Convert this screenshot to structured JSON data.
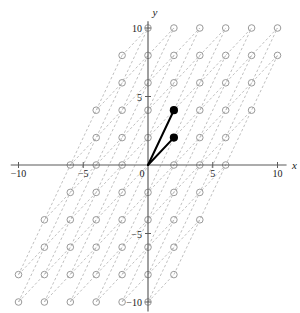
{
  "figure": {
    "title_clipped": "",
    "axis_labels": {
      "x": "x",
      "y": "y"
    },
    "x_ticks": [
      "-10",
      "-5",
      "0",
      "5",
      "10"
    ],
    "x_tick_values": [
      -10,
      -5,
      0,
      5,
      10
    ],
    "y_ticks": [
      "10",
      "5",
      "-5",
      "-10"
    ],
    "y_tick_values": [
      10,
      5,
      -5,
      -10
    ],
    "origin_label": "0"
  },
  "colors": {
    "axis": "#5a5a5a",
    "lattice_point": "#9a9a9a",
    "lattice_line": "#b0b0b0",
    "vector": "#000000",
    "background": "#ffffff",
    "text": "#1a1a1a"
  },
  "chart_data": {
    "type": "scatter",
    "title": "",
    "xlabel": "x",
    "ylabel": "y",
    "xlim": [
      -11,
      11
    ],
    "ylim": [
      -11,
      11
    ],
    "grid": false,
    "legend": null,
    "basis_vectors": [
      {
        "name": "v1",
        "x": 2,
        "y": 4,
        "style": "solid-black-with-dot"
      },
      {
        "name": "v2",
        "x": 2,
        "y": 2,
        "style": "solid-black-with-dot"
      }
    ],
    "lattice": {
      "basis": [
        [
          2,
          4
        ],
        [
          2,
          2
        ]
      ],
      "point_marker": "open-circle",
      "point_color": "#9a9a9a",
      "line_style": "dashed",
      "line_color": "#b0b0b0",
      "coefficient_range": [
        -6,
        6
      ]
    },
    "x_ticks": [
      -10,
      -5,
      0,
      5,
      10
    ],
    "y_ticks": [
      -10,
      -5,
      5,
      10
    ],
    "series": [
      {
        "name": "basis vectors",
        "points": [
          [
            2,
            4
          ],
          [
            2,
            2
          ]
        ]
      }
    ]
  }
}
